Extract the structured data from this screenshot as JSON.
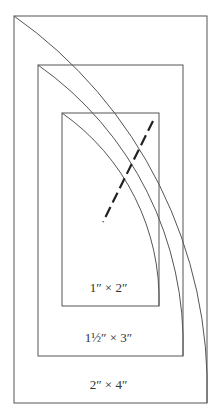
{
  "diagram": {
    "colors": {
      "line": "#555555",
      "dash": "#222222",
      "text": "#333333",
      "background": "#ffffff"
    },
    "rectangles": [
      {
        "id": "outer",
        "label": "2″ × 4″",
        "x": 14,
        "y": 16,
        "w": 193,
        "h": 387,
        "arc_radius": 455
      },
      {
        "id": "middle",
        "label": "1½″ × 3″",
        "x": 38,
        "y": 65,
        "w": 145,
        "h": 291,
        "arc_radius": 342
      },
      {
        "id": "inner",
        "label": "1″ × 2″",
        "x": 62,
        "y": 113,
        "w": 97,
        "h": 193,
        "arc_radius": 228
      }
    ],
    "dashed_line": {
      "x1": 153,
      "y1": 121,
      "x2": 103,
      "y2": 222
    }
  }
}
